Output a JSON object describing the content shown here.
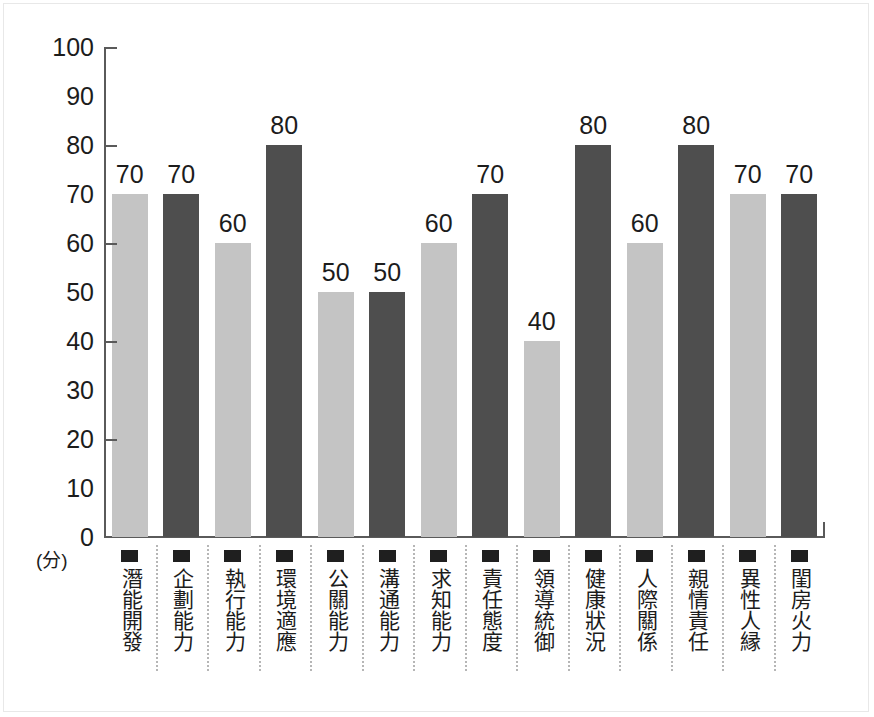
{
  "chart_data": {
    "type": "bar",
    "title": "",
    "subtitle": "",
    "xlabel": "",
    "ylabel": "(分)",
    "ylim": [
      0,
      100
    ],
    "ytick_step": 10,
    "ytick_mark_step": 20,
    "grid": false,
    "legend_position": "below-axis-per-category",
    "categories": [
      "潛能開發",
      "企劃能力",
      "執行能力",
      "環境適應",
      "公關能力",
      "溝通能力",
      "求知能力",
      "責任態度",
      "領導統御",
      "健康狀況",
      "人際關係",
      "親情責任",
      "異性人縁",
      "閨房火力"
    ],
    "values": [
      70,
      70,
      60,
      80,
      50,
      50,
      60,
      70,
      40,
      80,
      60,
      80,
      70,
      70
    ],
    "bar_shades": [
      "light",
      "dark",
      "light",
      "dark",
      "light",
      "dark",
      "light",
      "dark",
      "light",
      "dark",
      "light",
      "dark",
      "light",
      "dark"
    ],
    "ytick_labels": [
      "100",
      "90",
      "80",
      "70",
      "60",
      "50",
      "40",
      "30",
      "20",
      "10",
      "0"
    ],
    "ytick_values": [
      100,
      90,
      80,
      70,
      60,
      50,
      40,
      30,
      20,
      10,
      0
    ],
    "colors": {
      "bar_light": "#c4c4c4",
      "bar_dark": "#4e4e4e",
      "axis": "#5a5a5a",
      "text": "#1c1c1c",
      "separator": "#b6b6b6",
      "marker": "#1f1f1f",
      "background": "#ffffff"
    }
  }
}
